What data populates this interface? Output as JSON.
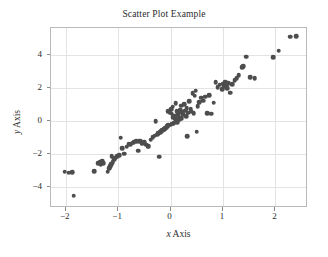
{
  "chart_data": {
    "type": "scatter",
    "title": "Scatter Plot Example",
    "xlabel": "x Axis",
    "ylabel": "y Axis",
    "xlabel_var": "x",
    "xlabel_rest": " Axis",
    "ylabel_var": "y",
    "ylabel_rest": " Axis",
    "xlim": [
      -2.28,
      2.62
    ],
    "ylim": [
      -5.25,
      5.65
    ],
    "xticks": [
      -2,
      -1,
      0,
      1,
      2
    ],
    "xtick_labels": [
      "−2",
      "−1",
      "0",
      "1",
      "2"
    ],
    "yticks": [
      -4,
      -2,
      0,
      2,
      4
    ],
    "ytick_labels": [
      "−4",
      "−2",
      "0",
      "2",
      "4"
    ],
    "grid": true,
    "legend": null,
    "marker_color": "#4d4d4d",
    "marker_size": 4.6,
    "grid_color": "#e3e3e3",
    "frame_color": "#b9b9b9",
    "n_points": 112,
    "points": [
      [
        -2.02,
        -3.05
      ],
      [
        -1.94,
        -3.12
      ],
      [
        -1.88,
        -3.1
      ],
      [
        -1.85,
        -4.5
      ],
      [
        -1.46,
        -3.02
      ],
      [
        -1.38,
        -2.55
      ],
      [
        -1.34,
        -2.48
      ],
      [
        -1.33,
        -2.6
      ],
      [
        -1.3,
        -2.42
      ],
      [
        -1.28,
        -2.52
      ],
      [
        -1.2,
        -3.05
      ],
      [
        -1.17,
        -2.85
      ],
      [
        -1.15,
        -2.72
      ],
      [
        -1.13,
        -2.6
      ],
      [
        -1.12,
        -2.12
      ],
      [
        -1.1,
        -2.48
      ],
      [
        -1.08,
        -2.3
      ],
      [
        -1.06,
        -2.2
      ],
      [
        -1.02,
        -2.1
      ],
      [
        -0.98,
        -2.05
      ],
      [
        -0.95,
        -1.0
      ],
      [
        -0.92,
        -1.62
      ],
      [
        -0.88,
        -1.95
      ],
      [
        -0.84,
        -1.55
      ],
      [
        -0.8,
        -1.4
      ],
      [
        -0.76,
        -1.38
      ],
      [
        -0.72,
        -1.3
      ],
      [
        -0.7,
        -1.26
      ],
      [
        -0.66,
        -1.22
      ],
      [
        -0.62,
        -1.78
      ],
      [
        -0.6,
        -1.2
      ],
      [
        -0.57,
        -1.18
      ],
      [
        -0.54,
        -1.35
      ],
      [
        -0.5,
        -1.28
      ],
      [
        -0.47,
        -1.42
      ],
      [
        -0.44,
        -1.55
      ],
      [
        -0.42,
        -1.5
      ],
      [
        -0.38,
        -1.12
      ],
      [
        -0.34,
        -0.95
      ],
      [
        -0.3,
        -0.88
      ],
      [
        -0.28,
        0.02
      ],
      [
        -0.26,
        -0.8
      ],
      [
        -0.24,
        -0.72
      ],
      [
        -0.22,
        -2.15
      ],
      [
        -0.2,
        -0.65
      ],
      [
        -0.18,
        -0.6
      ],
      [
        -0.16,
        -0.55
      ],
      [
        -0.14,
        -0.52
      ],
      [
        -0.12,
        -0.48
      ],
      [
        -0.1,
        -0.42
      ],
      [
        -0.08,
        -0.38
      ],
      [
        -0.06,
        -0.3
      ],
      [
        -0.05,
        0.6
      ],
      [
        -0.04,
        -0.25
      ],
      [
        -0.02,
        0.55
      ],
      [
        0.0,
        -0.2
      ],
      [
        0.01,
        0.72
      ],
      [
        0.02,
        0.45
      ],
      [
        0.03,
        -0.15
      ],
      [
        0.04,
        0.88
      ],
      [
        0.05,
        0.25
      ],
      [
        0.06,
        -0.1
      ],
      [
        0.07,
        0.35
      ],
      [
        0.08,
        0.15
      ],
      [
        0.1,
        1.1
      ],
      [
        0.11,
        0.05
      ],
      [
        0.12,
        0.62
      ],
      [
        0.13,
        -0.05
      ],
      [
        0.14,
        0.3
      ],
      [
        0.15,
        0.48
      ],
      [
        0.16,
        0.1
      ],
      [
        0.18,
        0.7
      ],
      [
        0.2,
        0.95
      ],
      [
        0.21,
        0.2
      ],
      [
        0.22,
        0.55
      ],
      [
        0.24,
        0.4
      ],
      [
        0.26,
        1.02
      ],
      [
        0.28,
        0.65
      ],
      [
        0.3,
        0.3
      ],
      [
        0.31,
        0.8
      ],
      [
        0.32,
        -0.9
      ],
      [
        0.34,
        0.52
      ],
      [
        0.36,
        1.2
      ],
      [
        0.38,
        0.72
      ],
      [
        0.4,
        0.58
      ],
      [
        0.42,
        1.7
      ],
      [
        0.44,
        0.48
      ],
      [
        0.46,
        1.55
      ],
      [
        0.48,
        1.85
      ],
      [
        0.5,
        -0.62
      ],
      [
        0.52,
        0.92
      ],
      [
        0.55,
        1.15
      ],
      [
        0.58,
        1.42
      ],
      [
        0.62,
        1.25
      ],
      [
        0.66,
        1.48
      ],
      [
        0.7,
        0.5
      ],
      [
        0.74,
        1.58
      ],
      [
        0.78,
        0.45
      ],
      [
        0.82,
        1.12
      ],
      [
        0.86,
        2.35
      ],
      [
        0.9,
        2.05
      ],
      [
        0.94,
        2.22
      ],
      [
        0.98,
        1.95
      ],
      [
        1.0,
        2.28
      ],
      [
        1.02,
        2.12
      ],
      [
        1.04,
        2.4
      ],
      [
        1.06,
        2.18
      ],
      [
        1.08,
        2.02
      ],
      [
        1.1,
        2.32
      ],
      [
        1.14,
        1.72
      ],
      [
        1.18,
        2.25
      ],
      [
        1.22,
        2.48
      ],
      [
        1.26,
        2.62
      ],
      [
        1.3,
        2.78
      ],
      [
        1.36,
        3.28
      ],
      [
        1.38,
        3.35
      ],
      [
        1.44,
        3.92
      ],
      [
        1.52,
        2.68
      ],
      [
        1.6,
        2.62
      ],
      [
        1.96,
        3.88
      ],
      [
        2.06,
        4.28
      ],
      [
        2.28,
        5.12
      ],
      [
        2.4,
        5.15
      ]
    ]
  }
}
